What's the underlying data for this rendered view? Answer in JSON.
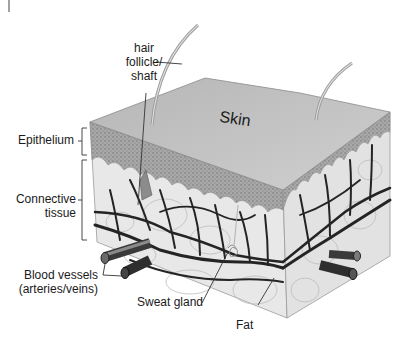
{
  "diagram": {
    "title": "Skin",
    "labels": {
      "hair": [
        "hair",
        "follicle/",
        "shaft"
      ],
      "epithelium": "Epithelium",
      "connective": [
        "Connective",
        "tissue"
      ],
      "blood_vessels": [
        "Blood vessels",
        "(arteries/veins)"
      ],
      "sweat_gland": "Sweat gland",
      "fat": "Fat"
    },
    "colors": {
      "top_surface": "#c4c4c4",
      "epithelium": "#9a9a9a",
      "dermis": "#e6e6e6",
      "vessel": "#2a2a2a",
      "label_text": "#1a1a1a",
      "leader_line": "#333333"
    }
  }
}
